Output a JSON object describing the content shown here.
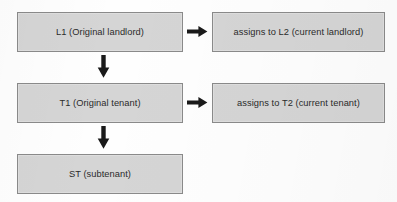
{
  "diagram": {
    "type": "flowchart",
    "background_color": "#ffffff",
    "node_fill_color": "#d5d5d5",
    "node_border_color": "#8a8a8a",
    "text_color": "#2b2b2b",
    "arrow_color": "#1a1a1a",
    "nodes": [
      {
        "id": "l1",
        "label": "L1 (Original landlord)",
        "column": "left",
        "row": 1
      },
      {
        "id": "l2",
        "label": "assigns to L2 (current landlord)",
        "column": "right",
        "row": 1
      },
      {
        "id": "t1",
        "label": "T1 (Original tenant)",
        "column": "left",
        "row": 2
      },
      {
        "id": "t2",
        "label": "assigns to T2 (current tenant)",
        "column": "right",
        "row": 2
      },
      {
        "id": "st",
        "label": "ST (subtenant)",
        "column": "left",
        "row": 3
      }
    ],
    "edges": [
      {
        "id": "l1-l2",
        "from": "l1",
        "to": "l2",
        "direction": "right",
        "label": ""
      },
      {
        "id": "t1-t2",
        "from": "t1",
        "to": "t2",
        "direction": "right",
        "label": ""
      },
      {
        "id": "l1-t1",
        "from": "l1",
        "to": "t1",
        "direction": "down",
        "label": ""
      },
      {
        "id": "t1-st",
        "from": "t1",
        "to": "st",
        "direction": "down",
        "label": ""
      }
    ]
  }
}
